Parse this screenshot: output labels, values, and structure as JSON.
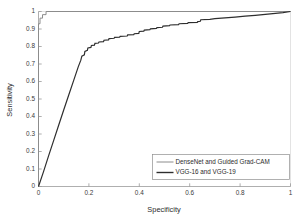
{
  "chart_data": {
    "type": "line",
    "title": "",
    "xlabel": "Specificity",
    "ylabel": "Sensitivity",
    "xlim": [
      0,
      1
    ],
    "ylim": [
      0,
      1
    ],
    "grid": false,
    "legend_position": "lower right",
    "xticks": [
      "0",
      "0.2",
      "0.4",
      "0.6",
      "0.8",
      "1"
    ],
    "xtick_values": [
      0,
      0.2,
      0.4,
      0.6,
      0.8,
      1
    ],
    "yticks": [
      "0",
      "0.1",
      "0.2",
      "0.3",
      "0.4",
      "0.5",
      "0.6",
      "0.7",
      "0.8",
      "0.9",
      "1"
    ],
    "ytick_values": [
      0,
      0.1,
      0.2,
      0.3,
      0.4,
      0.5,
      0.6,
      0.7,
      0.8,
      0.9,
      1
    ],
    "series": [
      {
        "name": "DenseNet and Guided Grad-CAM",
        "color": "#8c8c8c",
        "width": 1.0,
        "points": [
          [
            0.0,
            0.0
          ],
          [
            0.0,
            0.93
          ],
          [
            0.006,
            0.93
          ],
          [
            0.006,
            0.962
          ],
          [
            0.016,
            0.962
          ],
          [
            0.016,
            0.982
          ],
          [
            0.03,
            0.982
          ],
          [
            0.03,
            1.0
          ],
          [
            1.0,
            1.0
          ]
        ]
      },
      {
        "name": "VGG-16 and VGG-19",
        "color": "#2e2e2e",
        "width": 1.2,
        "points": [
          [
            0.0,
            0.0
          ],
          [
            0.02,
            0.085
          ],
          [
            0.04,
            0.175
          ],
          [
            0.06,
            0.262
          ],
          [
            0.08,
            0.35
          ],
          [
            0.1,
            0.437
          ],
          [
            0.12,
            0.523
          ],
          [
            0.14,
            0.608
          ],
          [
            0.158,
            0.685
          ],
          [
            0.168,
            0.722
          ],
          [
            0.172,
            0.745
          ],
          [
            0.182,
            0.752
          ],
          [
            0.184,
            0.772
          ],
          [
            0.194,
            0.778
          ],
          [
            0.196,
            0.792
          ],
          [
            0.208,
            0.795
          ],
          [
            0.21,
            0.806
          ],
          [
            0.222,
            0.808
          ],
          [
            0.224,
            0.818
          ],
          [
            0.238,
            0.82
          ],
          [
            0.24,
            0.826
          ],
          [
            0.258,
            0.828
          ],
          [
            0.26,
            0.836
          ],
          [
            0.278,
            0.838
          ],
          [
            0.28,
            0.845
          ],
          [
            0.3,
            0.847
          ],
          [
            0.302,
            0.852
          ],
          [
            0.322,
            0.854
          ],
          [
            0.324,
            0.858
          ],
          [
            0.352,
            0.86
          ],
          [
            0.354,
            0.866
          ],
          [
            0.378,
            0.868
          ],
          [
            0.38,
            0.873
          ],
          [
            0.398,
            0.875
          ],
          [
            0.4,
            0.886
          ],
          [
            0.418,
            0.888
          ],
          [
            0.42,
            0.894
          ],
          [
            0.442,
            0.896
          ],
          [
            0.444,
            0.901
          ],
          [
            0.468,
            0.903
          ],
          [
            0.47,
            0.908
          ],
          [
            0.492,
            0.91
          ],
          [
            0.494,
            0.917
          ],
          [
            0.52,
            0.919
          ],
          [
            0.522,
            0.923
          ],
          [
            0.556,
            0.925
          ],
          [
            0.558,
            0.93
          ],
          [
            0.592,
            0.932
          ],
          [
            0.594,
            0.936
          ],
          [
            0.63,
            0.938
          ],
          [
            0.632,
            0.942
          ],
          [
            0.642,
            0.944
          ],
          [
            0.644,
            0.953
          ],
          [
            0.68,
            0.955
          ],
          [
            0.7,
            0.959
          ],
          [
            0.74,
            0.963
          ],
          [
            0.78,
            0.968
          ],
          [
            0.82,
            0.973
          ],
          [
            0.86,
            0.978
          ],
          [
            0.9,
            0.983
          ],
          [
            0.94,
            0.989
          ],
          [
            0.97,
            0.994
          ],
          [
            1.0,
            1.0
          ]
        ]
      }
    ],
    "legend_entries": [
      {
        "label": "DenseNet and Guided Grad-CAM",
        "color": "#8c8c8c"
      },
      {
        "label": "VGG-16 and VGG-19",
        "color": "#2e2e2e"
      }
    ]
  }
}
